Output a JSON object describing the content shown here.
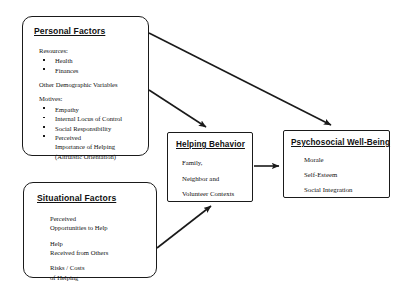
{
  "diagram": {
    "stroke_color": "#1a1a1a",
    "background_color": "#ffffff",
    "nodes": {
      "personal_factors": {
        "title": "Personal Factors",
        "groups": [
          {
            "label": "Resources:",
            "items": [
              "Health",
              "Finances"
            ]
          },
          {
            "label": "Other Demographic Variables",
            "items": []
          },
          {
            "label": "Motives:",
            "items": [
              "Empathy",
              "Internal Locus of Control",
              "Social Responsibility",
              "Perceived"
            ],
            "continuation": [
              "Importance of Helping",
              "(Altruistic Orientation)"
            ]
          }
        ]
      },
      "situational_factors": {
        "title": "Situational Factors",
        "pairs": [
          [
            "Perceived",
            "Opportunities to Help"
          ],
          [
            "Help",
            "Received from Others"
          ],
          [
            "Risks / Costs",
            "of Helping"
          ]
        ]
      },
      "helping_behavior": {
        "title": "Helping Behavior",
        "items": [
          "Family,",
          "Neighbor and",
          "Volunteer Contexts"
        ]
      },
      "psychosocial_wellbeing": {
        "title": "Psychosocial Well-Being",
        "items": [
          "Morale",
          "Self-Esteem",
          "Social Integration"
        ]
      }
    },
    "arrows": [
      {
        "name": "personal-to-wellbeing",
        "from": "personal_factors",
        "to": "psychosocial_wellbeing"
      },
      {
        "name": "personal-to-helping",
        "from": "personal_factors",
        "to": "helping_behavior"
      },
      {
        "name": "situational-to-helping",
        "from": "situational_factors",
        "to": "helping_behavior"
      },
      {
        "name": "helping-to-wellbeing",
        "from": "helping_behavior",
        "to": "psychosocial_wellbeing"
      }
    ]
  }
}
